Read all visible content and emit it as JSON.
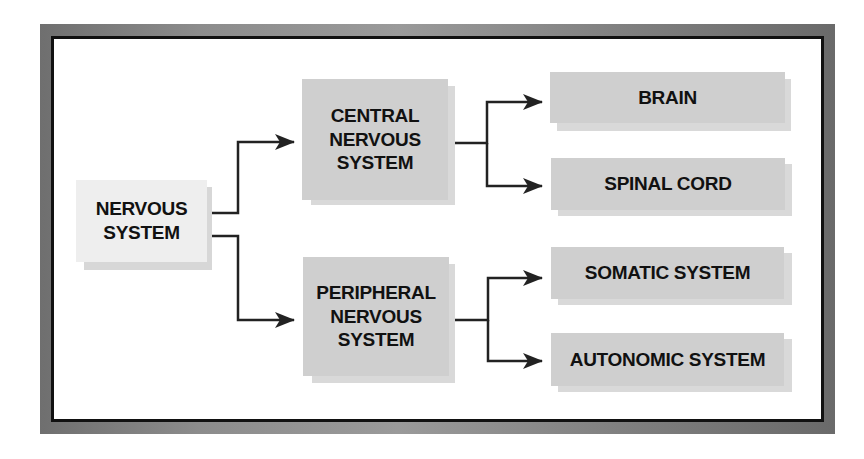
{
  "diagram": {
    "title": "",
    "root": {
      "id": "nervous-system",
      "label_lines": [
        "NERVOUS",
        "SYSTEM"
      ]
    },
    "level1": [
      {
        "id": "central-nervous-system",
        "label_lines": [
          "CENTRAL",
          "NERVOUS",
          "SYSTEM"
        ]
      },
      {
        "id": "peripheral-nervous-system",
        "label_lines": [
          "PERIPHERAL",
          "NERVOUS",
          "SYSTEM"
        ]
      }
    ],
    "level2": [
      {
        "id": "brain",
        "parent": "central-nervous-system",
        "label": "BRAIN"
      },
      {
        "id": "spinal-cord",
        "parent": "central-nervous-system",
        "label": "SPINAL CORD"
      },
      {
        "id": "somatic-system",
        "parent": "peripheral-nervous-system",
        "label": "SOMATIC SYSTEM"
      },
      {
        "id": "autonomic-system",
        "parent": "peripheral-nervous-system",
        "label": "AUTONOMIC SYSTEM"
      }
    ],
    "edges": [
      [
        "nervous-system",
        "central-nervous-system"
      ],
      [
        "nervous-system",
        "peripheral-nervous-system"
      ],
      [
        "central-nervous-system",
        "brain"
      ],
      [
        "central-nervous-system",
        "spinal-cord"
      ],
      [
        "peripheral-nervous-system",
        "somatic-system"
      ],
      [
        "peripheral-nervous-system",
        "autonomic-system"
      ]
    ],
    "colors": {
      "box_fill": "#cfcfcf",
      "root_fill": "#eeeeee",
      "shadow": "#d9d9d9",
      "text": "#111111",
      "line": "#222222",
      "frame": "#8a8a8a"
    }
  }
}
